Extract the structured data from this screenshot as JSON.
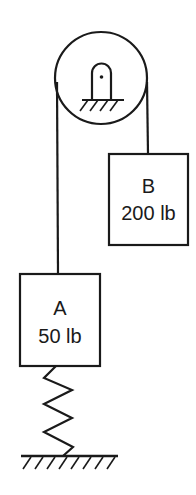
{
  "diagram": {
    "stroke_color": "#1a1a1a",
    "background": "#ffffff",
    "pulley": {
      "label": "pulley",
      "support": "fixed pin support"
    },
    "blocks": [
      {
        "id": "B",
        "name": "B",
        "weight": "200 lb"
      },
      {
        "id": "A",
        "name": "A",
        "weight": "50 lb"
      }
    ],
    "spring": {
      "label": "spring"
    },
    "ground": {
      "label": "fixed ground"
    }
  }
}
